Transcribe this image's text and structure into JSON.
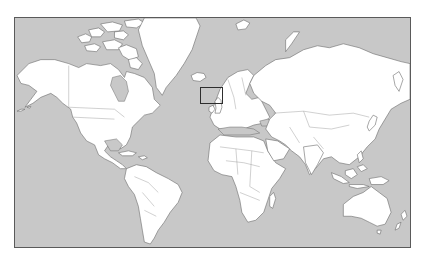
{
  "map": {
    "title": "World map",
    "projection": "Mercator",
    "colors": {
      "ocean": "#c8c8c8",
      "land": "#ffffff",
      "coastline": "#6a6a6a",
      "frame": "#5a5a5a",
      "highlight": "#2e2e2e"
    },
    "highlight": {
      "region": "British Isles",
      "label": "United Kingdom and Ireland highlighted"
    },
    "continents": [
      "North America",
      "Greenland",
      "South America",
      "Europe",
      "Africa",
      "Asia",
      "Australia",
      "New Zealand"
    ]
  }
}
